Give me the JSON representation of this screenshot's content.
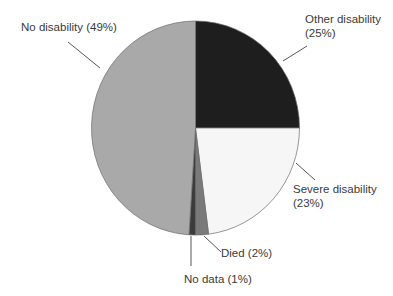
{
  "chart_data": {
    "type": "pie",
    "title": "",
    "categories": [
      "Other disability",
      "Severe disability",
      "Died",
      "No data",
      "No disability"
    ],
    "values": [
      25,
      23,
      2,
      1,
      49
    ],
    "unit": "%",
    "start_angle_deg": 0,
    "direction": "clockwise",
    "colors": [
      "#1e1e1e",
      "#f6f6f6",
      "#7a7a7a",
      "#3c3c3c",
      "#a9a9a9"
    ],
    "labels": [
      {
        "line1": "Other disability",
        "line2": "(25%)"
      },
      {
        "line1": "Severe disability",
        "line2": "(23%)"
      },
      {
        "line1": "Died (2%)",
        "line2": ""
      },
      {
        "line1": "No data (1%)",
        "line2": ""
      },
      {
        "line1": "No disability (49%)",
        "line2": ""
      }
    ],
    "legend": "none (direct labels with leader lines)"
  },
  "labels": {
    "other": {
      "line1": "Other disability",
      "line2": "(25%)"
    },
    "severe": {
      "line1": "Severe disability",
      "line2": "(23%)"
    },
    "died": "Died (2%)",
    "nodata": "No data (1%)",
    "none": "No disability (49%)"
  }
}
